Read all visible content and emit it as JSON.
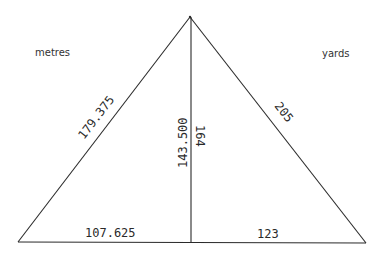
{
  "diagram": {
    "type": "right-triangle-split",
    "units": {
      "left": "metres",
      "right": "yards"
    },
    "labels": {
      "left_hypotenuse": "179.375",
      "left_height": "143.500",
      "left_base": "107.625",
      "right_hypotenuse": "205",
      "right_height": "164",
      "right_base": "123"
    },
    "colors": {
      "line": "#2a2a2a",
      "background": "#ffffff"
    }
  }
}
